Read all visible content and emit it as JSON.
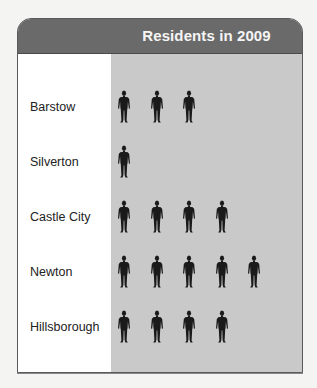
{
  "chart_data": {
    "type": "pictograph",
    "title": "Residents in 2009",
    "icon": "person-icon",
    "categories": [
      "Barstow",
      "Silverton",
      "Castle City",
      "Newton",
      "Hillsborough"
    ],
    "values": [
      3,
      1,
      4,
      5,
      4
    ],
    "legend": null
  },
  "colors": {
    "header": "#6a6a6a",
    "icon_area": "#c9c9c9",
    "icon": "#1a1a1a",
    "title_text": "#f5f5f5"
  }
}
